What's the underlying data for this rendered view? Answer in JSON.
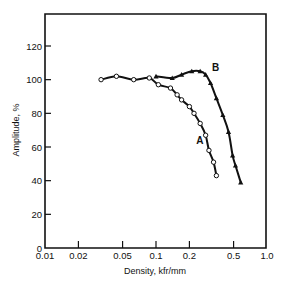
{
  "chart_data": {
    "type": "line",
    "title": "",
    "xlabel": "Density, kfr/mm",
    "ylabel": "Amplitude, %",
    "xscale": "log",
    "xlim": [
      0.01,
      1.0
    ],
    "ylim": [
      0,
      140
    ],
    "grid": false,
    "legend": "inline labels",
    "x_ticks": [
      {
        "value": 0.01,
        "label": "0.01"
      },
      {
        "value": 0.02,
        "label": "0.02"
      },
      {
        "value": 0.05,
        "label": "0.05"
      },
      {
        "value": 0.1,
        "label": "0.1"
      },
      {
        "value": 0.2,
        "label": "0.2"
      },
      {
        "value": 0.5,
        "label": "0.5"
      },
      {
        "value": 1.0,
        "label": "1.0"
      }
    ],
    "y_ticks": [
      {
        "value": 0,
        "label": "0"
      },
      {
        "value": 20,
        "label": "20"
      },
      {
        "value": 40,
        "label": "40"
      },
      {
        "value": 60,
        "label": "60"
      },
      {
        "value": 80,
        "label": "80"
      },
      {
        "value": 100,
        "label": "100"
      },
      {
        "value": 120,
        "label": "120"
      }
    ],
    "series": [
      {
        "name": "A",
        "marker": "circle-open",
        "label_pos": {
          "x": 0.23,
          "y": 62
        },
        "x": [
          0.032,
          0.044,
          0.063,
          0.087,
          0.105,
          0.135,
          0.155,
          0.17,
          0.2,
          0.22,
          0.25,
          0.28,
          0.3,
          0.33,
          0.35
        ],
        "values": [
          100,
          102,
          100,
          101,
          97,
          95,
          91,
          88,
          84,
          80,
          74,
          67,
          58,
          51,
          43
        ]
      },
      {
        "name": "B",
        "marker": "triangle-filled",
        "label_pos": {
          "x": 0.32,
          "y": 105
        },
        "x": [
          0.1,
          0.14,
          0.17,
          0.21,
          0.25,
          0.28,
          0.31,
          0.35,
          0.4,
          0.45,
          0.49,
          0.52,
          0.58
        ],
        "values": [
          102,
          101,
          103,
          105,
          105,
          103,
          98,
          89,
          79,
          69,
          55,
          49,
          39
        ]
      }
    ]
  }
}
